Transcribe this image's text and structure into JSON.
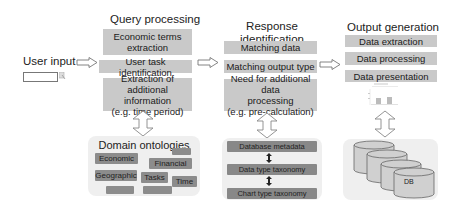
{
  "user_input": {
    "label": "User input"
  },
  "query_processing": {
    "title": "Query processing",
    "steps": [
      {
        "line1": "Economic terms",
        "line2": "extraction"
      },
      {
        "line1": "User task identification"
      },
      {
        "line1": "Extraction of additional",
        "line2": "information",
        "line3": "(e.g. time period)"
      }
    ]
  },
  "domain_ontologies": {
    "title": "Domain ontologies",
    "items": [
      "Economic",
      "Financial",
      "Geographic",
      "Tasks",
      "Time",
      "",
      "",
      ""
    ]
  },
  "response_identification": {
    "title_line1": "Response",
    "title_line2": "identification",
    "steps": [
      {
        "line1": "Matching data"
      },
      {
        "line1": "Matching output type"
      },
      {
        "line1": "Need for additional data",
        "line2": "processing",
        "line3": "(e.g. pre-calculation)"
      }
    ]
  },
  "metadata_stack": {
    "items": [
      "Database metadata",
      "Data type taxonomy",
      "Chart type taxonomy"
    ]
  },
  "output_generation": {
    "title": "Output generation",
    "steps": [
      "Data extraction",
      "Data processing",
      "Data presentation"
    ]
  },
  "database": {
    "label": "DB"
  },
  "colors": {
    "box_fill": "#c9c9c9",
    "panel_fill": "#efefef",
    "pill_fill": "#8c8c8c"
  }
}
